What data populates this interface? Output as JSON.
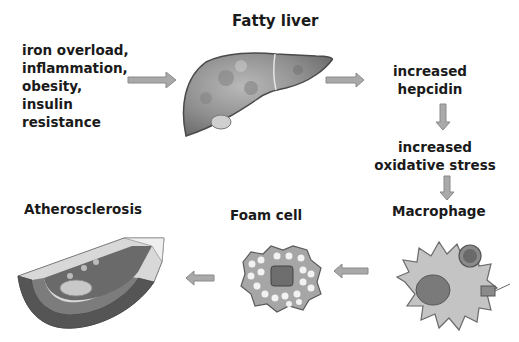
{
  "title": "Fatty liver",
  "causes": {
    "lines": [
      "iron overload,",
      "inflammation,",
      "obesity,",
      "insulin",
      "resistance"
    ]
  },
  "steps": {
    "hepcidin": [
      "increased",
      "hepcidin"
    ],
    "oxidative": [
      "increased",
      "oxidative stress"
    ],
    "macrophage": "Macrophage",
    "foam_cell": "Foam cell",
    "atherosclerosis": "Atherosclerosis"
  },
  "colors": {
    "arrow_fill": "#a9a9a9",
    "arrow_stroke": "#8a8a8a",
    "text": "#1a1a1a",
    "liver": "#8e8e8e",
    "cell": "#b8b8b8",
    "nucleus": "#6e6e6e"
  },
  "icons": [
    "liver-illustration",
    "macrophage-illustration",
    "foam-cell-illustration",
    "artery-illustration",
    "arrow-right",
    "arrow-down",
    "arrow-left"
  ]
}
